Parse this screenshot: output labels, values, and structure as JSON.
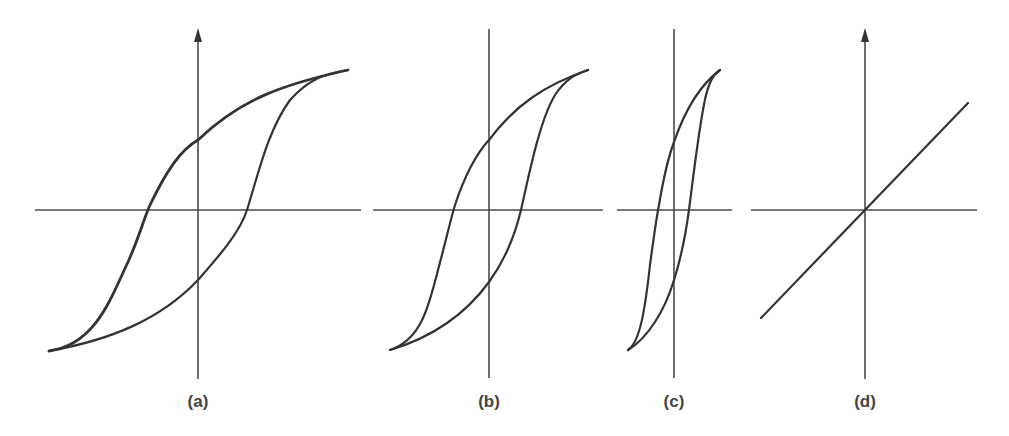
{
  "figure": {
    "panels": [
      {
        "id": "a",
        "label": "(a)",
        "description": "Wide hysteresis loop (hard magnetic material)",
        "y_axis_arrow": true
      },
      {
        "id": "b",
        "label": "(b)",
        "description": "Medium hysteresis loop",
        "y_axis_arrow": false
      },
      {
        "id": "c",
        "label": "(c)",
        "description": "Narrow hysteresis loop (soft magnetic material)",
        "y_axis_arrow": false
      },
      {
        "id": "d",
        "label": "(d)",
        "description": "Linear response through origin (no hysteresis)",
        "y_axis_arrow": true
      }
    ],
    "colors": {
      "line": "#333333",
      "axis": "#4a4a4a",
      "background": "#ffffff",
      "label": "#444444"
    }
  }
}
